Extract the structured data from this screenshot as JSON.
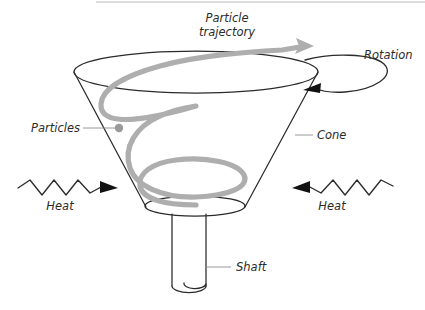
{
  "diagram": {
    "background_color": "#ffffff",
    "line_color": "#2b2b2b",
    "trajectory_color": "#aeaeae",
    "leader_color": "#8d8d8d",
    "labels": {
      "particle_trajectory_line1": "Particle",
      "particle_trajectory_line2": "trajectory",
      "rotation": "Rotation",
      "particles": "Particles",
      "cone": "Cone",
      "heat_left": "Heat",
      "heat_right": "Heat",
      "shaft": "Shaft"
    },
    "parts": [
      {
        "name": "cone",
        "label": "Cone"
      },
      {
        "name": "shaft",
        "label": "Shaft"
      },
      {
        "name": "particles",
        "label": "Particles"
      },
      {
        "name": "particle-trajectory",
        "label": "Particle trajectory"
      },
      {
        "name": "rotation",
        "label": "Rotation"
      },
      {
        "name": "heat-left",
        "label": "Heat"
      },
      {
        "name": "heat-right",
        "label": "Heat"
      }
    ],
    "geometry": {
      "cone_top_ellipse": {
        "cx": 196,
        "cy": 72,
        "rx": 122,
        "ry": 21
      },
      "cone_bottom_ellipse": {
        "cx": 195,
        "cy": 207,
        "rx": 50,
        "ry": 10
      },
      "shaft_left_x": 172,
      "shaft_right_x": 206,
      "shaft_top_y": 218,
      "shaft_bottom_y": 288
    }
  }
}
